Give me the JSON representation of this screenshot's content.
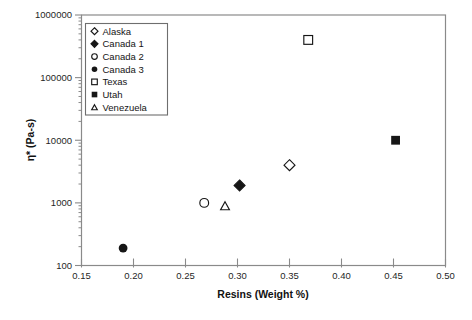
{
  "figure": {
    "background": "#ffffff",
    "frame_color": "#8a8a8a",
    "tick_color": "#8a8a8a",
    "text_color": "#1f1f1f",
    "marker_color": "#161616",
    "legend_border_color": "#6e6e6e"
  },
  "chart_data": {
    "type": "scatter",
    "title": "",
    "xlabel": "Resins (Weight %)",
    "ylabel": "η* (Pa-s)",
    "grid": false,
    "x_axis": {
      "scale": "linear",
      "min": 0.15,
      "max": 0.5,
      "ticks": [
        0.15,
        0.2,
        0.25,
        0.3,
        0.35,
        0.4,
        0.45,
        0.5
      ],
      "tick_labels": [
        "0.15",
        "0.20",
        "0.25",
        "0.30",
        "0.35",
        "0.40",
        "0.45",
        "0.50"
      ]
    },
    "y_axis": {
      "scale": "log",
      "min": 100,
      "max": 1000000,
      "ticks": [
        100,
        1000,
        10000,
        100000,
        1000000
      ],
      "tick_labels": [
        "100",
        "1000",
        "10000",
        "100000",
        "1000000"
      ],
      "minor_ticks": "log-decades"
    },
    "legend": {
      "position": "top-left-inside",
      "border": true
    },
    "series": [
      {
        "name": "Alaska",
        "marker": "diamond-open",
        "points": [
          [
            0.35,
            4000
          ]
        ]
      },
      {
        "name": "Canada 1",
        "marker": "diamond-filled",
        "points": [
          [
            0.302,
            1900
          ]
        ]
      },
      {
        "name": "Canada 2",
        "marker": "circle-open",
        "points": [
          [
            0.268,
            1000
          ]
        ]
      },
      {
        "name": "Canada 3",
        "marker": "circle-filled",
        "points": [
          [
            0.19,
            190
          ]
        ]
      },
      {
        "name": "Texas",
        "marker": "square-open",
        "points": [
          [
            0.368,
            400000
          ]
        ]
      },
      {
        "name": "Utah",
        "marker": "square-filled",
        "points": [
          [
            0.452,
            10000
          ]
        ]
      },
      {
        "name": "Venezuela",
        "marker": "triangle-open",
        "points": [
          [
            0.288,
            900
          ]
        ]
      }
    ]
  }
}
